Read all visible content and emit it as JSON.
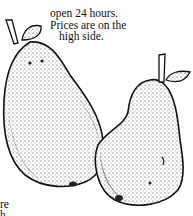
{
  "caption": {
    "lines": [
      "open 24 hours.",
      "Prices are on the",
      "high side."
    ]
  },
  "fragment": {
    "lines": [
      "re",
      "h"
    ]
  },
  "illustration": {
    "subject": "two-pears-illustration",
    "style": "stippled ink drawing"
  }
}
